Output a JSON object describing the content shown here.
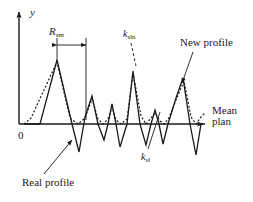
{
  "figure": {
    "kind": "surface-roughness-profile-diagram",
    "background": "#ffffff",
    "stroke_color": "#1a1a1a",
    "width": 253,
    "height": 202
  },
  "axes": {
    "y_axis_label": "y",
    "origin_label": "0",
    "x_axis_label_line1": "Mean",
    "x_axis_label_line2": "plan",
    "y_axis_x": 19,
    "baseline_y": 124,
    "x_axis_end": 207,
    "y_axis_top": 9
  },
  "annotations": {
    "rsm_symbol": "R",
    "rsm_subscript": "sm",
    "ksln_symbol": "k",
    "ksln_subscript": "sln",
    "ksl_symbol": "k",
    "ksl_subscript": "sl",
    "new_profile_label": "New profile",
    "real_profile_label": "Real profile"
  },
  "chart_data": {
    "type": "line",
    "title": "",
    "xlabel": "Mean plan",
    "ylabel": "y",
    "grid": false,
    "legend": [
      "Real profile",
      "New profile"
    ],
    "baseline": 124,
    "series": [
      {
        "name": "Real profile",
        "style": "solid",
        "points": "24,124 40,124 57,60 72,124 79,152 85,117 92,96 98,124 104,140 108,124 112,104 116,124 120,147 127,124 133,71 140,124 146,145 151,124 155,110 159,124 163,144 168,124 176,98 183,78 190,124 196,155 201,124 205,124"
      },
      {
        "name": "New profile",
        "style": "dotted",
        "points": "24,124 31,118 57,62 70,118 78,124 85,118 92,99 98,119 103,124 108,119 112,107 116,120 121,124 127,119 133,73 141,116 146,124 151,118 155,113 160,121 164,124 169,118 176,100 184,81 191,117 196,124 201,117 205,113"
      }
    ]
  },
  "dimension": {
    "rsm_left_x": 57,
    "rsm_right_x": 86,
    "rsm_arrow_y": 45,
    "rsm_ext_top": 38,
    "rsm_ext_bottom": 120
  },
  "leaders": {
    "ksln": {
      "from_x": 131,
      "from_y": 43,
      "to_x": 136,
      "to_y": 66,
      "dash": true
    },
    "ksl": {
      "from_x": 148,
      "from_y": 149,
      "to_x": 160,
      "to_y": 112,
      "dash": false
    },
    "new_profile": {
      "from_x": 193,
      "from_y": 52,
      "to_x": 182,
      "to_y": 83,
      "arrow": true
    },
    "real_profile": {
      "from_x": 44,
      "from_y": 174,
      "to_x": 72,
      "to_y": 140,
      "arrow": true
    }
  }
}
